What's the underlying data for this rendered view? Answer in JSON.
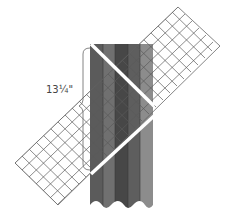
{
  "diagram": {
    "measurement_label": "13¼\"",
    "strip": {
      "x": 90,
      "y": 44,
      "width": 63,
      "height": 160,
      "stripes": [
        "#5b5b5b",
        "#707070",
        "#474747",
        "#5e5e5e",
        "#8c8c8c"
      ]
    },
    "grid_band": {
      "corners": [
        [
          15,
          163
        ],
        [
          58,
          205
        ],
        [
          220,
          46
        ],
        [
          178,
          7
        ]
      ],
      "cells_across": 6,
      "cells_along": 23,
      "line_color": "#555555"
    },
    "cut_lines": [
      {
        "x1": 92,
        "y1": 45,
        "x2": 153,
        "y2": 105
      },
      {
        "x1": 153,
        "y1": 116,
        "x2": 92,
        "y2": 173
      }
    ],
    "bracket": {
      "x": 83,
      "y_top": 48,
      "y_bottom": 170
    }
  }
}
